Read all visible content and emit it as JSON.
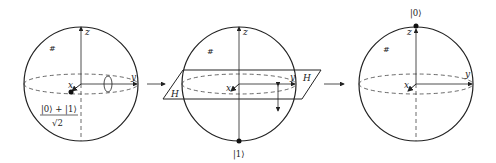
{
  "diagram": {
    "type": "bloch-sphere-sequence",
    "colors": {
      "stroke": "#222222",
      "background": "#ffffff"
    },
    "panels": [
      {
        "id": "initial",
        "axes": {
          "x": "x",
          "y": "y",
          "z": "z"
        },
        "hilbert_label": "#",
        "state_numerator": "|0⟩ + |1⟩",
        "state_denominator": "√2",
        "marker": "rotation arrow around y-axis"
      },
      {
        "id": "hadamard-plane",
        "axes": {
          "x": "x",
          "y": "y",
          "z": "z"
        },
        "hilbert_label": "#",
        "plane_label_left": "H",
        "plane_label_right": "H",
        "state_label": "|1⟩",
        "marker": "reflection arrow across H plane"
      },
      {
        "id": "final",
        "axes": {
          "x": "x",
          "y": "y",
          "z": "z"
        },
        "hilbert_label": "#",
        "state_label": "|0⟩"
      }
    ],
    "transitions": [
      "→",
      "→"
    ]
  }
}
